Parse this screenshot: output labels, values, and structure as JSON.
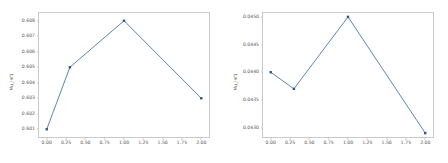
{
  "figure": {
    "background_color": "#ffffff",
    "panel_count": 2,
    "line_color": "#4878a8",
    "marker_color": "#31567f",
    "spine_color": "#c9c9c9",
    "tick_label_color": "#585858"
  },
  "chart_data": [
    {
      "type": "line",
      "title": "",
      "xlabel": "",
      "ylabel": "Mu_inf1",
      "x": [
        0.0,
        0.3,
        1.0,
        2.0
      ],
      "values": [
        0.601,
        0.605,
        0.608,
        0.603
      ],
      "series": [
        {
          "name": "Mu_inf1",
          "values": [
            0.601,
            0.605,
            0.608,
            0.603
          ]
        }
      ],
      "xlim": [
        -0.1,
        2.1
      ],
      "ylim": [
        0.6005,
        0.6085
      ],
      "xticks": [
        0.0,
        0.25,
        0.5,
        0.75,
        1.0,
        1.25,
        1.5,
        1.75,
        2.0
      ],
      "xticklabels": [
        "0.00",
        "0.25",
        "0.50",
        "0.75",
        "1.00",
        "1.25",
        "1.50",
        "1.75",
        "2.00"
      ],
      "yticks": [
        0.601,
        0.602,
        0.603,
        0.604,
        0.605,
        0.606,
        0.607,
        0.608
      ],
      "yticklabels": [
        "0.601",
        "0.602",
        "0.603",
        "0.604",
        "0.605",
        "0.606",
        "0.607",
        "0.608"
      ],
      "grid": false,
      "legend": false,
      "marker": "square"
    },
    {
      "type": "line",
      "title": "",
      "xlabel": "",
      "ylabel": "Mu_inf1",
      "x": [
        0.0,
        0.3,
        1.0,
        2.0
      ],
      "values": [
        0.044,
        0.0437,
        0.045,
        0.0429
      ],
      "series": [
        {
          "name": "Mu_inf1",
          "values": [
            0.044,
            0.0437,
            0.045,
            0.0429
          ]
        }
      ],
      "xlim": [
        -0.1,
        2.1
      ],
      "ylim": [
        0.04283,
        0.04507
      ],
      "xticks": [
        0.0,
        0.25,
        0.5,
        0.75,
        1.0,
        1.25,
        1.5,
        1.75,
        2.0
      ],
      "xticklabels": [
        "0.00",
        "0.25",
        "0.50",
        "0.75",
        "1.00",
        "1.25",
        "1.50",
        "1.75",
        "2.00"
      ],
      "yticks": [
        0.043,
        0.0435,
        0.044,
        0.0445,
        0.045
      ],
      "yticklabels": [
        "0.0430",
        "0.0435",
        "0.0440",
        "0.0445",
        "0.0450"
      ],
      "grid": false,
      "legend": false,
      "marker": "square"
    }
  ]
}
